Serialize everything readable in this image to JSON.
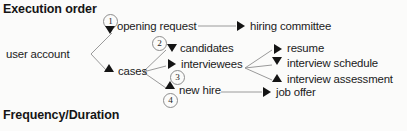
{
  "sections": [
    {
      "id": "execution-order",
      "title": "Execution order"
    },
    {
      "id": "frequency-duration",
      "title": "Frequency/Duration"
    }
  ],
  "diagram": {
    "root": {
      "label": "user account"
    },
    "nodes": [
      {
        "id": "opening-request",
        "label": "opening request",
        "step": "1",
        "arrow": "down"
      },
      {
        "id": "cases",
        "label": "cases",
        "arrow": "up"
      },
      {
        "id": "candidates",
        "label": "candidates",
        "step": "2",
        "arrow": "down"
      },
      {
        "id": "interviewees",
        "label": "interviewees",
        "step": "3",
        "arrow": "right"
      },
      {
        "id": "new-hire",
        "label": "new hire",
        "step": "4",
        "arrow": "up"
      },
      {
        "id": "hiring-committee",
        "label": "hiring committee",
        "arrow": "right"
      },
      {
        "id": "resume",
        "label": "resume",
        "arrow": "right"
      },
      {
        "id": "interview-schedule",
        "label": "interview schedule",
        "arrow": "down"
      },
      {
        "id": "interview-assessment",
        "label": "interview assessment",
        "arrow": "up"
      },
      {
        "id": "job-offer",
        "label": "job offer",
        "arrow": "right"
      }
    ],
    "steps": [
      "1",
      "2",
      "3",
      "4"
    ],
    "colors": {
      "arrow": "#141414",
      "connector": "#9a9a9a",
      "text": "#1a1a1a",
      "background": "#fbfbfa"
    }
  }
}
